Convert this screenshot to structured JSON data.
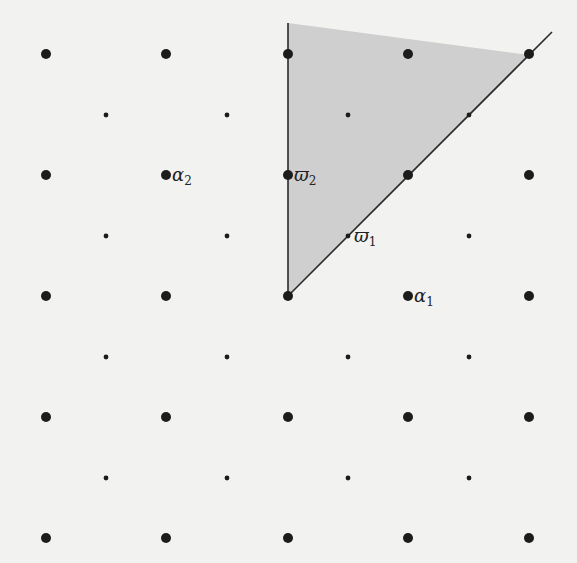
{
  "diagram": {
    "type": "root-lattice-weight-lattice",
    "colors": {
      "background": "#f2f2f0",
      "dot": "#1c1c1c",
      "line": "#2a2a2a",
      "chamber_fill": "#cfcfcf"
    },
    "large_dots": {
      "xs": [
        46,
        166,
        288,
        408,
        529
      ],
      "ys": [
        54,
        175,
        296,
        417,
        538
      ],
      "radius": 5
    },
    "small_dots": {
      "xs": [
        106,
        227,
        348,
        469
      ],
      "ys": [
        115,
        236,
        357,
        478
      ],
      "radius": 2.4
    },
    "chamber": {
      "origin": [
        288,
        296
      ],
      "vertical_ray_end": [
        288,
        23
      ],
      "diagonal_ray_end": [
        552,
        32
      ],
      "fill_polygon": [
        [
          288,
          296
        ],
        [
          288,
          23
        ],
        [
          529,
          55
        ]
      ]
    },
    "labels": [
      {
        "id": "alpha2",
        "base": "α",
        "sub": "2",
        "x": 172,
        "y": 181
      },
      {
        "id": "varpi2",
        "base": "ϖ",
        "sub": "2",
        "x": 294,
        "y": 181
      },
      {
        "id": "varpi1",
        "base": "ϖ",
        "sub": "1",
        "x": 354,
        "y": 242
      },
      {
        "id": "alpha1",
        "base": "α",
        "sub": "1",
        "x": 414,
        "y": 302
      }
    ]
  }
}
